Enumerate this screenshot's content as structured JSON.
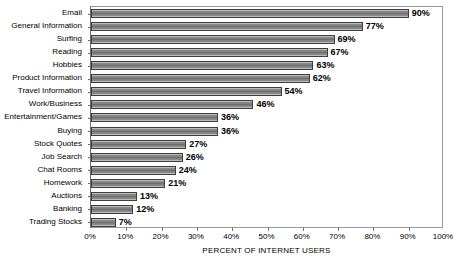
{
  "chart_data": {
    "type": "bar",
    "orientation": "horizontal",
    "title": "",
    "xlabel": "PERCENT OF INTERNET USERS",
    "ylabel": "",
    "xlim": [
      0,
      100
    ],
    "xticks": [
      "0%",
      "10%",
      "20%",
      "30%",
      "40%",
      "50%",
      "60%",
      "70%",
      "80%",
      "90%",
      "100%"
    ],
    "xtick_values": [
      0,
      10,
      20,
      30,
      40,
      50,
      60,
      70,
      80,
      90,
      100
    ],
    "grid": false,
    "legend": "none",
    "value_label_suffix": "%",
    "categories": [
      "Email",
      "General Information",
      "Surfing",
      "Reading",
      "Hobbies",
      "Product Information",
      "Travel Information",
      "Work/Business",
      "Entertainment/Games",
      "Buying",
      "Stock Quotes",
      "Job Search",
      "Chat Rooms",
      "Homework",
      "Auctions",
      "Banking",
      "Trading Stocks"
    ],
    "values": [
      90,
      77,
      69,
      67,
      63,
      62,
      54,
      46,
      36,
      36,
      27,
      26,
      24,
      21,
      13,
      12,
      7
    ],
    "value_labels": [
      "90%",
      "77%",
      "69%",
      "67%",
      "63%",
      "62%",
      "54%",
      "46%",
      "36%",
      "36%",
      "27%",
      "26%",
      "24%",
      "21%",
      "13%",
      "12%",
      "7%"
    ],
    "colors": {
      "bar_fill": "#7d7d7d",
      "bar_border": "#3e3e3e",
      "axis": "#6b6b6b",
      "plot_background": "#ffffff",
      "text": "#000000"
    }
  }
}
